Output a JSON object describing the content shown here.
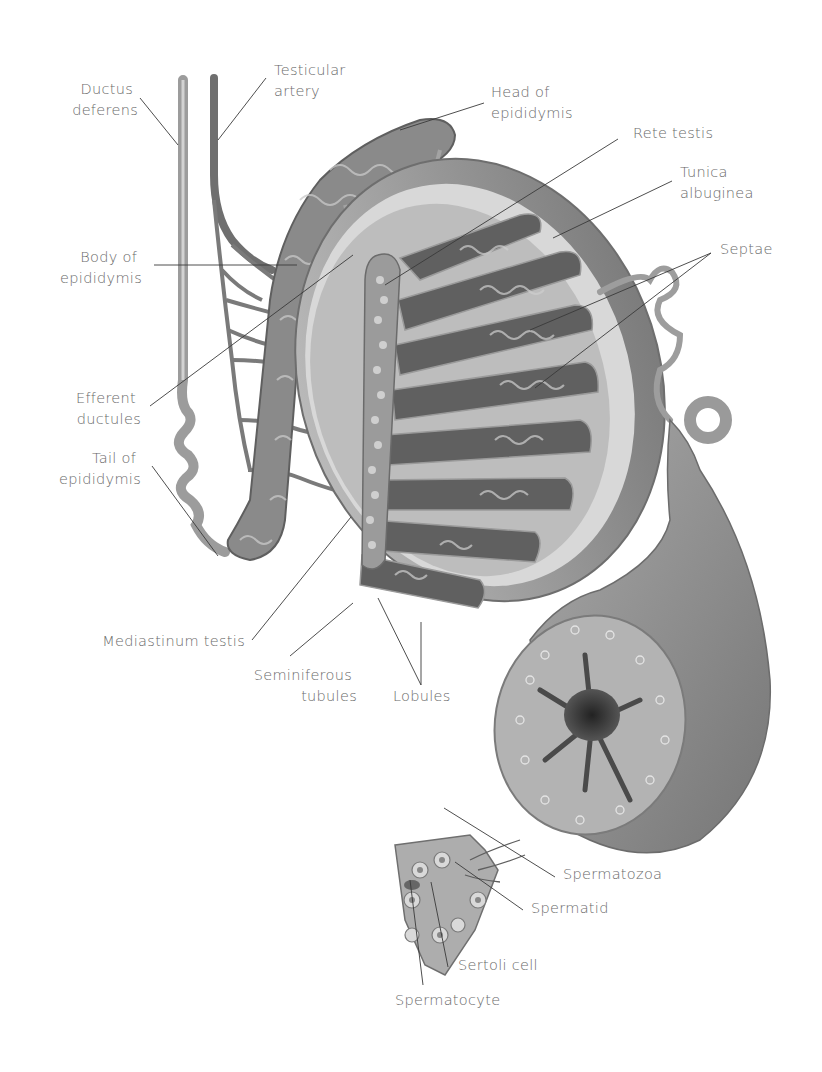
{
  "diagram": {
    "labels": {
      "ductus_deferens": [
        "Ductus",
        "deferens"
      ],
      "testicular_artery": [
        "Testicular",
        "artery"
      ],
      "head_of_epididymis": [
        "Head of",
        "epididymis"
      ],
      "rete_testis": [
        "Rete testis"
      ],
      "tunica_albuginea": [
        "Tunica",
        "albuginea"
      ],
      "septae": [
        "Septae"
      ],
      "body_of_epididymis": [
        "Body of",
        "epididymis"
      ],
      "efferent_ductules": [
        "Efferent",
        "ductules"
      ],
      "tail_of_epididymis": [
        "Tail of",
        "epididymis"
      ],
      "mediastinum_testis": [
        "Mediastinum testis"
      ],
      "seminiferous_tubules": [
        "Seminiferous",
        "tubules"
      ],
      "lobules": [
        "Lobules"
      ],
      "spermatozoa": [
        "Spermatozoa"
      ],
      "spermatid": [
        "Spermatid"
      ],
      "sertoli_cell": [
        "Sertoli cell"
      ],
      "spermatocyte": [
        "Spermatocyte"
      ]
    },
    "colors": {
      "background": "#ffffff",
      "label_text": "#6a6a6a",
      "leader_line": "#3a3a3a",
      "tissue_dark": "#5a5a5a",
      "tissue_mid": "#8c8c8c",
      "tissue_light": "#c8c8c8"
    }
  }
}
